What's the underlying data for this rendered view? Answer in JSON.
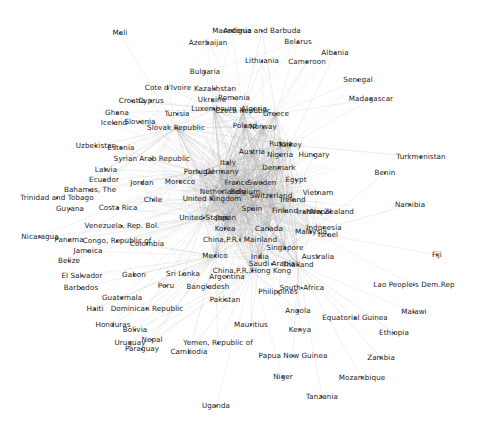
{
  "figure": {
    "kind": "network-graph",
    "title": "",
    "layout": "force-directed",
    "background": "#ffffff",
    "edge_color": "#9a9a9a",
    "node_color": "#3a3a3a",
    "label_color": "#1b1b1b",
    "width": 484,
    "height": 433
  },
  "chart_data": {
    "type": "scatter",
    "title": "",
    "xlabel": "",
    "ylabel": "",
    "grid": false,
    "legend": "none",
    "node_count": 142,
    "nodes": [
      {
        "label": "Mali",
        "x": 120,
        "y": 33,
        "degree": 1
      },
      {
        "label": "Macedonia",
        "x": 232,
        "y": 31,
        "degree": 3
      },
      {
        "label": "Antigua and Barbuda",
        "x": 262,
        "y": 31,
        "degree": 2
      },
      {
        "label": "Azerbaijan",
        "x": 208,
        "y": 43,
        "degree": 3
      },
      {
        "label": "Belarus",
        "x": 298,
        "y": 42,
        "degree": 3
      },
      {
        "label": "Albania",
        "x": 335,
        "y": 53,
        "degree": 2
      },
      {
        "label": "Lithuania",
        "x": 262,
        "y": 61,
        "degree": 4
      },
      {
        "label": "Cameroon",
        "x": 307,
        "y": 62,
        "degree": 3
      },
      {
        "label": "Bulgaria",
        "x": 205,
        "y": 72,
        "degree": 5
      },
      {
        "label": "Senegal",
        "x": 358,
        "y": 80,
        "degree": 2
      },
      {
        "label": "Cote d'Ivoire",
        "x": 168,
        "y": 88,
        "degree": 2
      },
      {
        "label": "Kazakhstan",
        "x": 215,
        "y": 89,
        "degree": 4
      },
      {
        "label": "Madagascar",
        "x": 371,
        "y": 99,
        "degree": 2
      },
      {
        "label": "Croatia",
        "x": 132,
        "y": 101,
        "degree": 5
      },
      {
        "label": "Cyprus",
        "x": 151,
        "y": 101,
        "degree": 4
      },
      {
        "label": "Ukraine",
        "x": 212,
        "y": 100,
        "degree": 5
      },
      {
        "label": "Romania",
        "x": 234,
        "y": 98,
        "degree": 5
      },
      {
        "label": "Ghana",
        "x": 117,
        "y": 113,
        "degree": 2
      },
      {
        "label": "Tunisia",
        "x": 177,
        "y": 114,
        "degree": 3
      },
      {
        "label": "Luxembourg",
        "x": 214,
        "y": 109,
        "degree": 6
      },
      {
        "label": "Czech Republic",
        "x": 243,
        "y": 111,
        "degree": 7
      },
      {
        "label": "Algeria",
        "x": 254,
        "y": 109,
        "degree": 4
      },
      {
        "label": "Greece",
        "x": 276,
        "y": 114,
        "degree": 6
      },
      {
        "label": "Iceland",
        "x": 114,
        "y": 123,
        "degree": 3
      },
      {
        "label": "Slovenia",
        "x": 140,
        "y": 122,
        "degree": 5
      },
      {
        "label": "Slovak Republic",
        "x": 176,
        "y": 128,
        "degree": 6
      },
      {
        "label": "Poland",
        "x": 245,
        "y": 126,
        "degree": 7
      },
      {
        "label": "Norway",
        "x": 263,
        "y": 127,
        "degree": 7
      },
      {
        "label": "Turkey",
        "x": 290,
        "y": 145,
        "degree": 7
      },
      {
        "label": "Russia",
        "x": 281,
        "y": 144,
        "degree": 7
      },
      {
        "label": "Uzbekistan",
        "x": 96,
        "y": 146,
        "degree": 2
      },
      {
        "label": "Estonia",
        "x": 121,
        "y": 148,
        "degree": 4
      },
      {
        "label": "Austria",
        "x": 252,
        "y": 152,
        "degree": 8
      },
      {
        "label": "Nigeria",
        "x": 280,
        "y": 155,
        "degree": 4
      },
      {
        "label": "Hungary",
        "x": 314,
        "y": 155,
        "degree": 5
      },
      {
        "label": "Turkmenistan",
        "x": 421,
        "y": 157,
        "degree": 1
      },
      {
        "label": "Syrian Arab Republic",
        "x": 152,
        "y": 159,
        "degree": 3
      },
      {
        "label": "Italy",
        "x": 228,
        "y": 163,
        "degree": 9
      },
      {
        "label": "Denmark",
        "x": 279,
        "y": 168,
        "degree": 7
      },
      {
        "label": "Latvia",
        "x": 106,
        "y": 170,
        "degree": 3
      },
      {
        "label": "Portugal",
        "x": 199,
        "y": 172,
        "degree": 7
      },
      {
        "label": "Germany",
        "x": 222,
        "y": 172,
        "degree": 10
      },
      {
        "label": "Benin",
        "x": 385,
        "y": 173,
        "degree": 1
      },
      {
        "label": "Ecuador",
        "x": 104,
        "y": 180,
        "degree": 3
      },
      {
        "label": "Jordan",
        "x": 142,
        "y": 183,
        "degree": 3
      },
      {
        "label": "Morocco",
        "x": 180,
        "y": 182,
        "degree": 3
      },
      {
        "label": "France",
        "x": 237,
        "y": 183,
        "degree": 10
      },
      {
        "label": "Sweden",
        "x": 262,
        "y": 183,
        "degree": 8
      },
      {
        "label": "Egypt",
        "x": 296,
        "y": 180,
        "degree": 4
      },
      {
        "label": "Bahamas, The",
        "x": 90,
        "y": 190,
        "degree": 2
      },
      {
        "label": "Netherlands",
        "x": 222,
        "y": 192,
        "degree": 9
      },
      {
        "label": "Belgium",
        "x": 245,
        "y": 192,
        "degree": 9
      },
      {
        "label": "Switzerland",
        "x": 271,
        "y": 196,
        "degree": 7
      },
      {
        "label": "Vietnam",
        "x": 318,
        "y": 193,
        "degree": 4
      },
      {
        "label": "Trinidad and Tobago",
        "x": 57,
        "y": 198,
        "degree": 2
      },
      {
        "label": "United Kingdom",
        "x": 212,
        "y": 199,
        "degree": 10
      },
      {
        "label": "Ireland",
        "x": 293,
        "y": 200,
        "degree": 6
      },
      {
        "label": "Namibia",
        "x": 410,
        "y": 205,
        "degree": 1
      },
      {
        "label": "Chile",
        "x": 153,
        "y": 200,
        "degree": 4
      },
      {
        "label": "Guyana",
        "x": 70,
        "y": 209,
        "degree": 1
      },
      {
        "label": "Costa Rica",
        "x": 118,
        "y": 208,
        "degree": 2
      },
      {
        "label": "Spain",
        "x": 252,
        "y": 209,
        "degree": 9
      },
      {
        "label": "Finland",
        "x": 285,
        "y": 211,
        "degree": 6
      },
      {
        "label": "Iran",
        "x": 304,
        "y": 212,
        "degree": 4
      },
      {
        "label": "New Zealand",
        "x": 330,
        "y": 212,
        "degree": 4
      },
      {
        "label": "Nepal",
        "x": 321,
        "y": 212,
        "degree": 2
      },
      {
        "label": "United States",
        "x": 204,
        "y": 218,
        "degree": 12
      },
      {
        "label": "Japan",
        "x": 226,
        "y": 218,
        "degree": 10
      },
      {
        "label": "Venezuela, Rep. Bol.",
        "x": 122,
        "y": 226,
        "degree": 3
      },
      {
        "label": "Korea",
        "x": 225,
        "y": 229,
        "degree": 8
      },
      {
        "label": "Canada",
        "x": 269,
        "y": 229,
        "degree": 8
      },
      {
        "label": "Malaysia",
        "x": 311,
        "y": 232,
        "degree": 6
      },
      {
        "label": "Indonesia",
        "x": 324,
        "y": 228,
        "degree": 5
      },
      {
        "label": "Israel",
        "x": 328,
        "y": 235,
        "degree": 4
      },
      {
        "label": "Fiji",
        "x": 437,
        "y": 255,
        "degree": 1
      },
      {
        "label": "Nicaragua",
        "x": 40,
        "y": 237,
        "degree": 2
      },
      {
        "label": "Panama",
        "x": 69,
        "y": 240,
        "degree": 2
      },
      {
        "label": "Congo, Republic of",
        "x": 117,
        "y": 241,
        "degree": 2
      },
      {
        "label": "Colombia",
        "x": 147,
        "y": 244,
        "degree": 3
      },
      {
        "label": "China,P.R.: Mainland",
        "x": 240,
        "y": 240,
        "degree": 10
      },
      {
        "label": "Jamaica",
        "x": 88,
        "y": 251,
        "degree": 2
      },
      {
        "label": "Singapore",
        "x": 285,
        "y": 248,
        "degree": 7
      },
      {
        "label": "Mexico",
        "x": 215,
        "y": 256,
        "degree": 6
      },
      {
        "label": "India",
        "x": 260,
        "y": 257,
        "degree": 7
      },
      {
        "label": "Australia",
        "x": 318,
        "y": 257,
        "degree": 6
      },
      {
        "label": "Belize",
        "x": 69,
        "y": 261,
        "degree": 1
      },
      {
        "label": "Saudi Arabia",
        "x": 272,
        "y": 264,
        "degree": 5
      },
      {
        "label": "Thailand",
        "x": 298,
        "y": 265,
        "degree": 6
      },
      {
        "label": "Gabon",
        "x": 134,
        "y": 275,
        "degree": 1
      },
      {
        "label": "Sri Lanka",
        "x": 183,
        "y": 274,
        "degree": 3
      },
      {
        "label": "China,P.R.:Hong Kong",
        "x": 252,
        "y": 271,
        "degree": 6
      },
      {
        "label": "Argentina",
        "x": 227,
        "y": 277,
        "degree": 5
      },
      {
        "label": "El Salvador",
        "x": 82,
        "y": 276,
        "degree": 1
      },
      {
        "label": "Lao People's Dem.Rep",
        "x": 414,
        "y": 285,
        "degree": 1
      },
      {
        "label": "Peru",
        "x": 166,
        "y": 286,
        "degree": 3
      },
      {
        "label": "Bangladesh",
        "x": 208,
        "y": 287,
        "degree": 3
      },
      {
        "label": "Barbados",
        "x": 81,
        "y": 288,
        "degree": 1
      },
      {
        "label": "South Africa",
        "x": 302,
        "y": 288,
        "degree": 5
      },
      {
        "label": "Philippines",
        "x": 278,
        "y": 292,
        "degree": 5
      },
      {
        "label": "Guatemala",
        "x": 122,
        "y": 298,
        "degree": 2
      },
      {
        "label": "Pakistan",
        "x": 225,
        "y": 300,
        "degree": 4
      },
      {
        "label": "Malawi",
        "x": 414,
        "y": 312,
        "degree": 1
      },
      {
        "label": "Haiti",
        "x": 95,
        "y": 309,
        "degree": 1
      },
      {
        "label": "Dominican Republic",
        "x": 147,
        "y": 309,
        "degree": 2
      },
      {
        "label": "Angola",
        "x": 298,
        "y": 311,
        "degree": 2
      },
      {
        "label": "Equatorial Guinea",
        "x": 355,
        "y": 318,
        "degree": 1
      },
      {
        "label": "Ethiopia",
        "x": 394,
        "y": 333,
        "degree": 1
      },
      {
        "label": "Honduras",
        "x": 113,
        "y": 325,
        "degree": 2
      },
      {
        "label": "Bolivia",
        "x": 135,
        "y": 330,
        "degree": 2
      },
      {
        "label": "Mauritius",
        "x": 251,
        "y": 325,
        "degree": 2
      },
      {
        "label": "Kenya",
        "x": 300,
        "y": 330,
        "degree": 2
      },
      {
        "label": "Uruguay",
        "x": 130,
        "y": 343,
        "degree": 2
      },
      {
        "label": "Nepal2",
        "x": 152,
        "y": 340,
        "degree": 2
      },
      {
        "label": "Yemen, Republic of",
        "x": 218,
        "y": 343,
        "degree": 2
      },
      {
        "label": "Zambia",
        "x": 381,
        "y": 358,
        "degree": 1
      },
      {
        "label": "Paraguay",
        "x": 142,
        "y": 349,
        "degree": 2
      },
      {
        "label": "Cambodia",
        "x": 189,
        "y": 352,
        "degree": 2
      },
      {
        "label": "Papua New Guinea",
        "x": 293,
        "y": 356,
        "degree": 1
      },
      {
        "label": "Mozambique",
        "x": 362,
        "y": 378,
        "degree": 1
      },
      {
        "label": "Niger",
        "x": 283,
        "y": 377,
        "degree": 1
      },
      {
        "label": "Tanzania",
        "x": 322,
        "y": 397,
        "degree": 1
      },
      {
        "label": "Uganda",
        "x": 216,
        "y": 406,
        "degree": 1
      }
    ],
    "hub_center": {
      "x": 235,
      "y": 195
    },
    "edge_count_estimate": 900
  },
  "labels": {
    "all": [
      "Mali",
      "Macedonia",
      "Antigua and Barbuda",
      "Azerbaijan",
      "Belarus",
      "Albania",
      "Lithuania",
      "Cameroon",
      "Bulgaria",
      "Senegal",
      "Cote d'Ivoire",
      "Kazakhstan",
      "Madagascar",
      "Croatia",
      "Cyprus",
      "Ukraine",
      "Romania",
      "Ghana",
      "Tunisia",
      "Luxembourg",
      "Czech Republic",
      "Algeria",
      "Greece",
      "Iceland",
      "Slovenia",
      "Slovak Republic",
      "Poland",
      "Norway",
      "Turkey",
      "Russia",
      "Uzbekistan",
      "Estonia",
      "Austria",
      "Nigeria",
      "Hungary",
      "Turkmenistan",
      "Syrian Arab Republic",
      "Italy",
      "Denmark",
      "Latvia",
      "Portugal",
      "Germany",
      "Benin",
      "Ecuador",
      "Jordan",
      "Morocco",
      "France",
      "Sweden",
      "Egypt",
      "Bahamas, The",
      "Netherlands",
      "Belgium",
      "Switzerland",
      "Vietnam",
      "Trinidad and Tobago",
      "United Kingdom",
      "Ireland",
      "Namibia",
      "Chile",
      "Guyana",
      "Costa Rica",
      "Spain",
      "Finland",
      "Iran",
      "New Zealand",
      "Nepal",
      "United States",
      "Japan",
      "Venezuela, Rep. Bol.",
      "Korea",
      "Canada",
      "Malaysia",
      "Indonesia",
      "Israel",
      "Fiji",
      "Nicaragua",
      "Panama",
      "Congo, Republic of",
      "Colombia",
      "China,P.R.: Mainland",
      "Jamaica",
      "Singapore",
      "Mexico",
      "India",
      "Australia",
      "Belize",
      "Saudi Arabia",
      "Thailand",
      "Gabon",
      "Sri Lanka",
      "China,P.R.:Hong Kong",
      "Argentina",
      "El Salvador",
      "Lao People's Dem.Rep",
      "Peru",
      "Bangladesh",
      "Barbados",
      "South Africa",
      "Philippines",
      "Guatemala",
      "Pakistan",
      "Malawi",
      "Haiti",
      "Dominican Republic",
      "Angola",
      "Equatorial Guinea",
      "Ethiopia",
      "Honduras",
      "Bolivia",
      "Mauritius",
      "Kenya",
      "Uruguay",
      "Yemen, Republic of",
      "Zambia",
      "Paraguay",
      "Cambodia",
      "Papua New Guinea",
      "Mozambique",
      "Niger",
      "Tanzania",
      "Uganda"
    ]
  }
}
